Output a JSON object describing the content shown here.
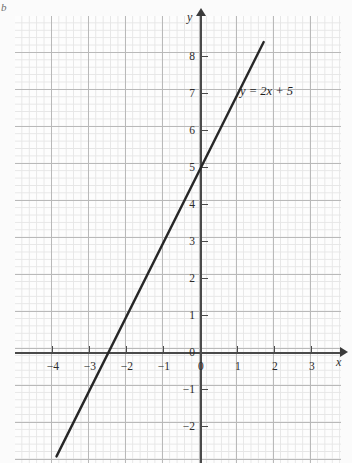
{
  "figure": {
    "part_label": "b",
    "background_color": "#fbfbfb"
  },
  "chart_data": {
    "type": "line",
    "title": "",
    "xlabel": "x",
    "ylabel": "y",
    "grid": true,
    "grid_minor": true,
    "legend": "none",
    "annotations": [
      {
        "text": "y = 2x + 5",
        "x": 1.1,
        "y": 7.2
      }
    ],
    "series": [
      {
        "name": "y = 2x + 5",
        "equation": "y = 2x + 5",
        "slope": 2,
        "intercept": 5,
        "color": "#272727",
        "x": [
          -3.9,
          1.7
        ],
        "y": [
          -2.8,
          8.4
        ],
        "points": [
          {
            "x": -2.5,
            "y": 0
          },
          {
            "x": 0,
            "y": 5
          },
          {
            "x": 1.5,
            "y": 8
          }
        ]
      }
    ],
    "xlim": [
      -4.6,
      3.8
    ],
    "ylim": [
      -2.9,
      9.1
    ],
    "xticks": [
      -4,
      -3,
      -2,
      -1,
      0,
      1,
      2,
      3
    ],
    "yticks": [
      8,
      7,
      6,
      5,
      4,
      3,
      2,
      1,
      0,
      -1,
      -2
    ],
    "xtick_labels": [
      "−4",
      "−3",
      "−2",
      "−1",
      "0",
      "1",
      "2",
      "3"
    ],
    "ytick_labels": [
      "8",
      "7",
      "6",
      "5",
      "4",
      "3",
      "2",
      "1",
      "0",
      "−1",
      "−2"
    ],
    "colors": {
      "line": "#272727",
      "axis": "#4a4a4a",
      "grid_major": "#b9b9b9",
      "grid_minor": "#e6e6e6",
      "background": "#fdfdfd"
    }
  },
  "axes": {
    "x_name": "x",
    "y_name": "y"
  }
}
